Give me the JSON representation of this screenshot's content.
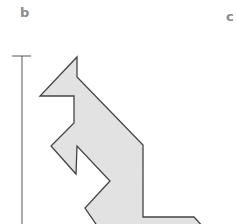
{
  "panels": {
    "left_label": "b",
    "right_label": "c"
  },
  "figure": {
    "shape_fill": "#e2e2e2",
    "shape_stroke": "#444444",
    "scale_bar_color": "#555555",
    "shape_points": "77,57 77,77 143,145 143,217 194,217 206,230 100,230 85,208 110,181 77,146 76,174 51,146 74,123 74,96 40,96",
    "scale_bar": {
      "x": 22,
      "y_top": 56,
      "y_bottom": 224,
      "tick_x1": 12,
      "tick_x2": 31
    }
  }
}
